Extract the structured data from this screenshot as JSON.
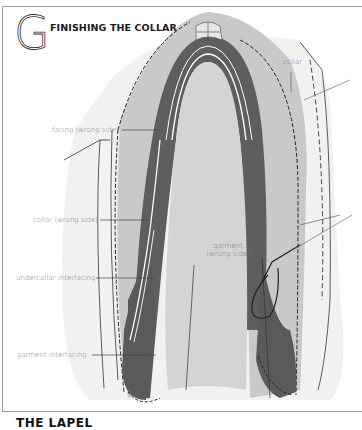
{
  "section": {
    "letter": "G",
    "title": "FINISHING THE COLLAR"
  },
  "labels": {
    "collar": "collar",
    "facing": "facing (wrong side)",
    "collar_wrong_side": "collar (wrong side)",
    "undercollar_interfacing": "undercollar interfacing",
    "garment_line1": "garment",
    "garment_line2": "(wrong side)",
    "garment_interfacing": "garment  interfacing"
  },
  "next_heading": "THE LAPEL",
  "colors": {
    "dark_fill": "#5a5a5a",
    "mid_fill": "#bdbdbd",
    "light_fill": "#d9d9d9",
    "pale_fill": "#ececec",
    "line": "#222222",
    "label_text": "#777777"
  }
}
